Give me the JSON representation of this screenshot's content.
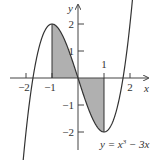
{
  "figure": {
    "function_label": "y = x³ − 3x",
    "function_parts": {
      "lhs": "y = x",
      "exp": "3",
      "rhs": " − 3x"
    },
    "axis_labels": {
      "x": "x",
      "y": "y"
    },
    "x_ticks": [
      {
        "value": -2,
        "label": "−2"
      },
      {
        "value": -1,
        "label": "−1"
      },
      {
        "value": 1,
        "label": "1"
      },
      {
        "value": 2,
        "label": "2"
      }
    ],
    "y_ticks": [
      {
        "value": 2,
        "label": "2"
      },
      {
        "value": 1,
        "label": "1"
      },
      {
        "value": -1,
        "label": "−1"
      },
      {
        "value": -2,
        "label": "−2"
      }
    ],
    "shaded_region": {
      "from": -1,
      "to": 1,
      "color": "#b0b0b0"
    },
    "curve_color": "#333333",
    "axis_color": "#444444"
  }
}
